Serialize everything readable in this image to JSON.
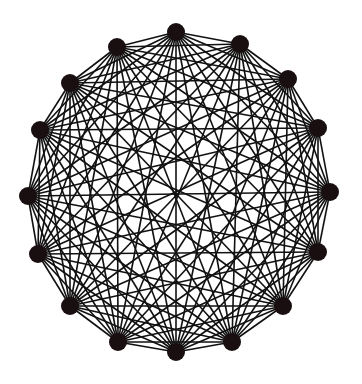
{
  "diagram": {
    "type": "complete-graph",
    "background": "#ffffff",
    "edge_color": "#111111",
    "node_color": "#1a0f10",
    "node_radius": 9,
    "edge_width": 1.6,
    "nodes": [
      {
        "id": 0,
        "x": 176,
        "y": 32
      },
      {
        "id": 1,
        "x": 240,
        "y": 44
      },
      {
        "id": 2,
        "x": 288,
        "y": 79
      },
      {
        "id": 3,
        "x": 318,
        "y": 128
      },
      {
        "id": 4,
        "x": 330,
        "y": 192
      },
      {
        "id": 5,
        "x": 318,
        "y": 252
      },
      {
        "id": 6,
        "x": 283,
        "y": 306
      },
      {
        "id": 7,
        "x": 232,
        "y": 342
      },
      {
        "id": 8,
        "x": 176,
        "y": 352
      },
      {
        "id": 9,
        "x": 118,
        "y": 342
      },
      {
        "id": 10,
        "x": 70,
        "y": 306
      },
      {
        "id": 11,
        "x": 38,
        "y": 254
      },
      {
        "id": 12,
        "x": 28,
        "y": 196
      },
      {
        "id": 13,
        "x": 40,
        "y": 130
      },
      {
        "id": 14,
        "x": 70,
        "y": 83
      },
      {
        "id": 15,
        "x": 117,
        "y": 47
      }
    ]
  }
}
